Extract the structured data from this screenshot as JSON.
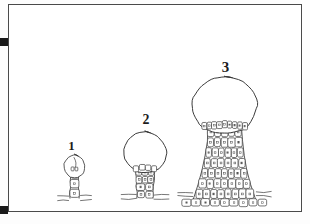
{
  "plate": {
    "kind": "scientific-line-drawing",
    "caption_numbers_visible": true,
    "background_color": "#ffffff",
    "ink_color": "#3a3a3a",
    "frame_color": "#4a4a4a",
    "crop_mark_color": "#1a1a1a"
  },
  "crop_marks": [
    {
      "name": "top-left-crop-mark",
      "x": 0,
      "y": 38,
      "size": 8
    },
    {
      "name": "bottom-left-crop-mark",
      "x": 0,
      "y": 206,
      "size": 8
    }
  ],
  "figures": [
    {
      "label": "1",
      "label_x": 71,
      "label_y": 150,
      "stage": "earliest",
      "head_cx": 74,
      "head_cy": 167,
      "head_rx": 11,
      "head_ry": 12,
      "stalk_top_y": 170,
      "stalk_base_y": 199,
      "stalk_top_half_width": 4,
      "stalk_base_half_width": 5,
      "ground_y": 197,
      "ground_half_width": 17,
      "cell_rows": 3,
      "cell_cols_top": 1,
      "cell_cols_base": 1
    },
    {
      "label": "2",
      "label_x": 146,
      "label_y": 124,
      "stage": "intermediate",
      "head_cx": 145,
      "head_cy": 153,
      "head_rx": 22,
      "head_ry": 21,
      "stalk_top_y": 169,
      "stalk_base_y": 199,
      "stalk_top_half_width": 9,
      "stalk_base_half_width": 8,
      "ground_y": 196,
      "ground_half_width": 24,
      "cell_rows": 4,
      "cell_cols_top": 3,
      "cell_cols_base": 2
    },
    {
      "label": "3",
      "label_x": 226,
      "label_y": 72,
      "stage": "mature",
      "head_cx": 225,
      "head_cy": 105,
      "head_rx": 33,
      "head_ry": 30,
      "stalk_top_y": 127,
      "stalk_base_y": 200,
      "stalk_top_half_width": 17,
      "stalk_base_half_width": 31,
      "ground_y": 193,
      "ground_half_width": 47,
      "cell_rows": 7,
      "cell_cols_top": 5,
      "cell_cols_base": 8
    }
  ]
}
